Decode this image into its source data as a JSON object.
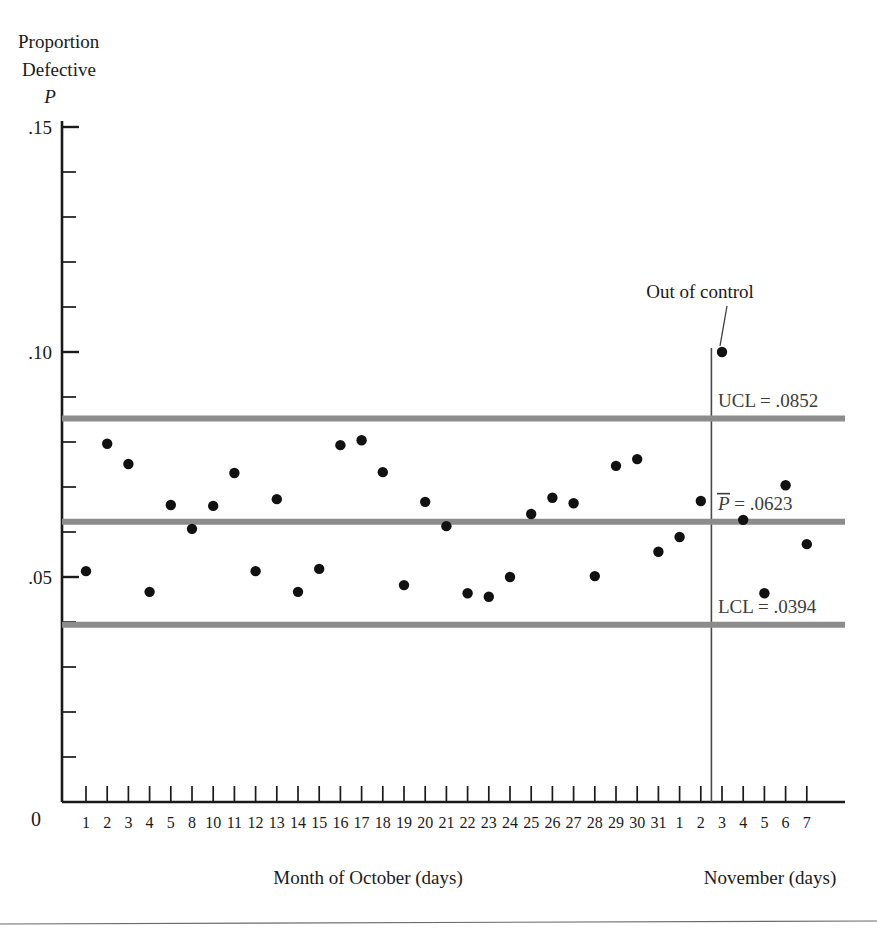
{
  "figure": {
    "background_color": "#ffffff",
    "axis_color": "#1a1a1a",
    "limit_line_color": "#8c8c8c",
    "point_color": "#111111",
    "divider_color": "#4a4a4a",
    "footer_rule_color": "#6b6b6b"
  },
  "labels": {
    "y_axis_title_line1": "Proportion",
    "y_axis_title_line2": "Defective",
    "y_axis_symbol": "P",
    "origin": "0",
    "x_caption_left": "Month of October (days)",
    "x_caption_right": "November (days)",
    "annotation": "Out of control",
    "ucl_label": "UCL = .0852",
    "center_label_symbol": "P",
    "center_label_rest": " = .0623",
    "lcl_label": "LCL = .0394"
  },
  "chart_data": {
    "type": "scatter",
    "title": "",
    "subtitle": "",
    "xlabel": "Month of October (days) / November (days)",
    "ylabel": "Proportion Defective P",
    "ylim": [
      0,
      0.15
    ],
    "ytick_values": [
      0.01,
      0.02,
      0.03,
      0.04,
      0.05,
      0.06,
      0.07,
      0.08,
      0.09,
      0.1,
      0.11,
      0.12,
      0.13,
      0.14,
      0.15
    ],
    "ytick_labeled": [
      {
        "value": 0.05,
        "label": ".05"
      },
      {
        "value": 0.1,
        "label": ".10"
      },
      {
        "value": 0.15,
        "label": ".15"
      }
    ],
    "grid": false,
    "legend_position": "none",
    "control_limits": {
      "ucl": 0.0852,
      "center": 0.0623,
      "lcl": 0.0394
    },
    "month_divider_after_index": 30,
    "categories": [
      "1",
      "2",
      "3",
      "4",
      "5",
      "8",
      "10",
      "11",
      "12",
      "13",
      "14",
      "15",
      "16",
      "17",
      "18",
      "19",
      "20",
      "21",
      "22",
      "23",
      "24",
      "25",
      "26",
      "27",
      "28",
      "29",
      "30",
      "31",
      "1",
      "2",
      "3",
      "4",
      "5",
      "6",
      "7"
    ],
    "values": [
      0.0513,
      0.0796,
      0.0751,
      0.0467,
      0.066,
      0.0607,
      0.0658,
      0.0731,
      0.0513,
      0.0673,
      0.0467,
      0.0518,
      0.0793,
      0.0804,
      0.0733,
      0.0482,
      0.0667,
      0.0613,
      0.0464,
      0.0456,
      0.05,
      0.064,
      0.0676,
      0.0664,
      0.0502,
      0.0747,
      0.0762,
      0.0556,
      0.0589,
      0.0669,
      0.1,
      0.0627,
      0.0464,
      0.0704,
      0.0573
    ],
    "out_of_control_points": [
      {
        "category": "3",
        "month": "November",
        "index": 30,
        "value": 0.1
      }
    ]
  }
}
